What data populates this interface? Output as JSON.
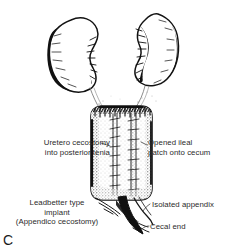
{
  "figure": {
    "letter": "C",
    "background_color": "#ffffff",
    "ink_color": "#1a1a1a",
    "label_color": "#2b2b2b",
    "width": 226,
    "height": 251
  },
  "labels": {
    "uretero_cecostomy": {
      "line1": "Uretero cecostomy",
      "line2": "into posterior tenia"
    },
    "opened_ileal_patch": {
      "line1": "Opened ileal",
      "line2": "patch onto cecum"
    },
    "leadbetter_implant": {
      "line1": "Leadbetter type",
      "line2": "implant",
      "line3": "(Appendico cecostomy)"
    },
    "isolated_appendix": {
      "line1": "Isolated appendix"
    },
    "cecal_end": {
      "line1": "Cecal end"
    }
  },
  "anatomy": {
    "left_kidney": "left-kidney",
    "right_kidney": "right-kidney",
    "left_ureter": "left-ureter",
    "right_ureter": "right-ureter",
    "cecum": "cecum-with-ileal-patch",
    "appendix": "isolated-appendix",
    "posterior_tenia": "posterior-tenia"
  }
}
